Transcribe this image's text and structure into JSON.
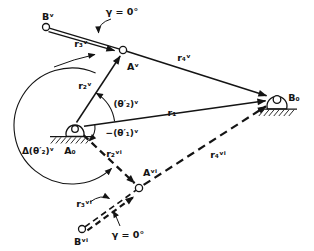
{
  "figure": {
    "colors": {
      "ink": "#141414",
      "background": "#ffffff"
    },
    "joints": {
      "B_v": "Bᵛ",
      "A_v": "Aᵛ",
      "A_0": "A₀",
      "B_0": "B₀",
      "A_vi": "Aᵛⁱ",
      "B_vi": "Bᵛⁱ"
    },
    "vectors": {
      "r1": "r₁",
      "r2_v": "r₂ᵛ",
      "r3_v": "r₃ᵛ",
      "r4_v": "r₄ᵛ",
      "r2_vi": "r₂ᵛⁱ",
      "r3_vi": "r₃ᵛⁱ",
      "r4_vi": "r₄ᵛⁱ"
    },
    "angles": {
      "theta2_v": "(θ′₂)ᵛ",
      "neg_theta1_v": "−(θ′₁)ᵛ",
      "delta_theta2_v": "Δ(θ′₂)ᵛ",
      "gamma_top": "γ = 0°",
      "gamma_bottom": "γ = 0°"
    }
  }
}
